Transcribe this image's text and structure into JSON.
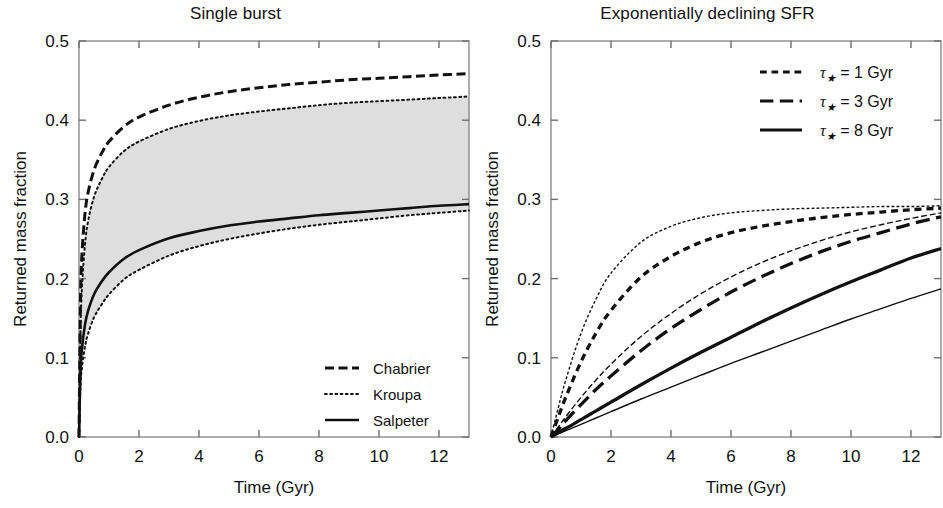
{
  "figure": {
    "width": 943,
    "height": 508,
    "background": "#ffffff",
    "ink": "#111111",
    "band_fill": "#dedede"
  },
  "panels": [
    {
      "id": "single-burst",
      "title": "Single burst",
      "xlabel": "Time (Gyr)",
      "ylabel": "Returned mass fraction",
      "xlim": [
        0,
        13
      ],
      "ylim": [
        0.0,
        0.5
      ],
      "xticks": [
        0,
        2,
        4,
        6,
        8,
        10,
        12
      ],
      "xticklabels": [
        "0",
        "2",
        "4",
        "6",
        "8",
        "10",
        "12"
      ],
      "yticks": [
        0.0,
        0.1,
        0.2,
        0.3,
        0.4,
        0.5
      ],
      "yticklabels": [
        "0.0",
        "0.1",
        "0.2",
        "0.3",
        "0.4",
        "0.5"
      ],
      "grid": false,
      "legend_position": "lower-right",
      "legend": [
        {
          "label": "Chabrier",
          "style": "dashed",
          "width": 3.0
        },
        {
          "label": "Kroupa",
          "style": "dotted",
          "width": 2.0
        },
        {
          "label": "Salpeter",
          "style": "solid",
          "width": 2.6
        }
      ]
    },
    {
      "id": "exponentially-declining-sfr",
      "title": "Exponentially declining SFR",
      "xlabel": "Time (Gyr)",
      "ylabel": "Returned mass fraction",
      "xlim": [
        0,
        13
      ],
      "ylim": [
        0.0,
        0.5
      ],
      "xticks": [
        0,
        2,
        4,
        6,
        8,
        10,
        12
      ],
      "xticklabels": [
        "0",
        "2",
        "4",
        "6",
        "8",
        "10",
        "12"
      ],
      "yticks": [
        0.0,
        0.1,
        0.2,
        0.3,
        0.4,
        0.5
      ],
      "yticklabels": [
        "0.0",
        "0.1",
        "0.2",
        "0.3",
        "0.4",
        "0.5"
      ],
      "grid": false,
      "legend_position": "upper-right",
      "legend": [
        {
          "label_sym": "τ",
          "label_sub": "★",
          "label": "= 1 Gyr",
          "style": "dashed-short",
          "width": 3.2
        },
        {
          "label_sym": "τ",
          "label_sub": "★",
          "label": "= 3 Gyr",
          "style": "dashed-long",
          "width": 3.2
        },
        {
          "label_sym": "τ",
          "label_sub": "★",
          "label": "= 8 Gyr",
          "style": "solid",
          "width": 3.2
        }
      ]
    }
  ],
  "chart_data": [
    {
      "type": "line",
      "panel": "Single burst",
      "title": "Single burst",
      "xlabel": "Time (Gyr)",
      "ylabel": "Returned mass fraction",
      "xlim": [
        0,
        13
      ],
      "ylim": [
        0.0,
        0.5
      ],
      "grid": false,
      "legend_position": "lower-right",
      "shaded_band": {
        "label": "Kroupa range",
        "fill": "#dedede",
        "upper_series": "Kroupa upper",
        "lower_series": "Kroupa lower"
      },
      "x": [
        0,
        0.05,
        0.1,
        0.2,
        0.3,
        0.5,
        0.75,
        1,
        1.5,
        2,
        3,
        4,
        5,
        6,
        7,
        8,
        9,
        10,
        11,
        12,
        13
      ],
      "series": [
        {
          "name": "Chabrier",
          "style": "dashed",
          "values": [
            0.0,
            0.175,
            0.232,
            0.282,
            0.308,
            0.337,
            0.358,
            0.373,
            0.392,
            0.404,
            0.419,
            0.429,
            0.436,
            0.441,
            0.445,
            0.448,
            0.451,
            0.453,
            0.455,
            0.457,
            0.459
          ]
        },
        {
          "name": "Kroupa upper",
          "style": "dotted",
          "values": [
            0.0,
            0.135,
            0.19,
            0.243,
            0.272,
            0.303,
            0.325,
            0.341,
            0.361,
            0.373,
            0.389,
            0.399,
            0.406,
            0.411,
            0.415,
            0.419,
            0.422,
            0.424,
            0.426,
            0.428,
            0.43
          ]
        },
        {
          "name": "Salpeter",
          "style": "solid",
          "values": [
            0.0,
            0.083,
            0.112,
            0.142,
            0.159,
            0.18,
            0.196,
            0.208,
            0.225,
            0.236,
            0.251,
            0.26,
            0.267,
            0.272,
            0.276,
            0.28,
            0.283,
            0.286,
            0.289,
            0.292,
            0.294
          ]
        },
        {
          "name": "Kroupa lower",
          "style": "dotted",
          "values": [
            0.0,
            0.065,
            0.088,
            0.114,
            0.13,
            0.151,
            0.167,
            0.18,
            0.199,
            0.211,
            0.229,
            0.241,
            0.25,
            0.257,
            0.263,
            0.268,
            0.272,
            0.276,
            0.28,
            0.283,
            0.286
          ]
        }
      ]
    },
    {
      "type": "line",
      "panel": "Exponentially declining SFR",
      "title": "Exponentially declining SFR",
      "xlabel": "Time (Gyr)",
      "ylabel": "Returned mass fraction",
      "xlim": [
        0,
        13
      ],
      "ylim": [
        0.0,
        0.5
      ],
      "grid": false,
      "legend_position": "upper-right",
      "x": [
        0,
        0.25,
        0.5,
        1,
        1.5,
        2,
        3,
        4,
        5,
        6,
        7,
        8,
        9,
        10,
        11,
        12,
        13
      ],
      "series": [
        {
          "name": "tau = 1 Gyr (thin)",
          "style": "dashed-short",
          "linewidth": "thin",
          "values": [
            0.0,
            0.038,
            0.073,
            0.131,
            0.174,
            0.207,
            0.246,
            0.266,
            0.277,
            0.283,
            0.286,
            0.288,
            0.289,
            0.29,
            0.291,
            0.291,
            0.292
          ]
        },
        {
          "name": "tau = 1 Gyr (thick)",
          "style": "dashed-short",
          "linewidth": "thick",
          "values": [
            0.0,
            0.026,
            0.051,
            0.095,
            0.131,
            0.16,
            0.202,
            0.228,
            0.246,
            0.258,
            0.266,
            0.272,
            0.277,
            0.281,
            0.284,
            0.287,
            0.289
          ]
        },
        {
          "name": "tau = 3 Gyr (thin)",
          "style": "dashed-long",
          "linewidth": "thin",
          "values": [
            0.0,
            0.013,
            0.026,
            0.05,
            0.072,
            0.092,
            0.127,
            0.156,
            0.181,
            0.202,
            0.22,
            0.235,
            0.248,
            0.259,
            0.268,
            0.276,
            0.283
          ]
        },
        {
          "name": "tau = 3 Gyr (thick)",
          "style": "dashed-long",
          "linewidth": "thick",
          "values": [
            0.0,
            0.01,
            0.021,
            0.041,
            0.06,
            0.077,
            0.109,
            0.137,
            0.161,
            0.183,
            0.202,
            0.219,
            0.234,
            0.247,
            0.258,
            0.269,
            0.278
          ]
        },
        {
          "name": "tau = 8 Gyr (thin)",
          "style": "solid",
          "linewidth": "thin",
          "values": [
            0.0,
            0.004,
            0.008,
            0.016,
            0.024,
            0.032,
            0.048,
            0.063,
            0.078,
            0.093,
            0.107,
            0.121,
            0.135,
            0.149,
            0.162,
            0.175,
            0.187
          ]
        },
        {
          "name": "tau = 8 Gyr (thick)",
          "style": "solid",
          "linewidth": "thick",
          "values": [
            0.0,
            0.006,
            0.011,
            0.022,
            0.033,
            0.044,
            0.066,
            0.087,
            0.107,
            0.126,
            0.145,
            0.163,
            0.18,
            0.196,
            0.211,
            0.226,
            0.238
          ]
        }
      ]
    }
  ]
}
